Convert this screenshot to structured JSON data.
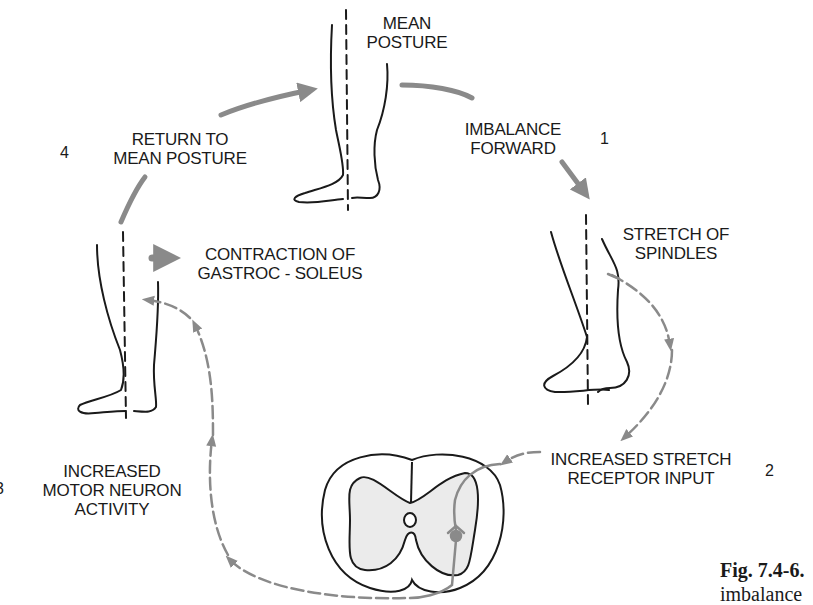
{
  "figure": {
    "steps": [
      {
        "id": 1,
        "number": "1",
        "label_lines": [
          "IMBALANCE",
          "FORWARD"
        ]
      },
      {
        "id": 2,
        "number": "2",
        "label_lines": [
          "INCREASED STRETCH",
          "RECEPTOR INPUT"
        ]
      },
      {
        "id": 3,
        "number": "3",
        "label_lines": [
          "INCREASED",
          "MOTOR NEURON",
          "ACTIVITY"
        ]
      },
      {
        "id": 4,
        "number": "4",
        "label_lines": [
          "RETURN TO",
          "MEAN POSTURE"
        ]
      }
    ],
    "labels": {
      "mean_posture": [
        "MEAN",
        "POSTURE"
      ],
      "stretch_of_spindles": [
        "STRETCH OF",
        "SPINDLES"
      ],
      "contraction": [
        "CONTRACTION OF",
        "GASTROC - SOLEUS"
      ]
    },
    "caption": {
      "fig_number": "Fig. 7.4-6.",
      "text": "imbalance"
    },
    "colors": {
      "ink": "#1a1a1a",
      "arrow_gray": "#8a8a8a",
      "gray_matter": "#ebebeb"
    }
  }
}
